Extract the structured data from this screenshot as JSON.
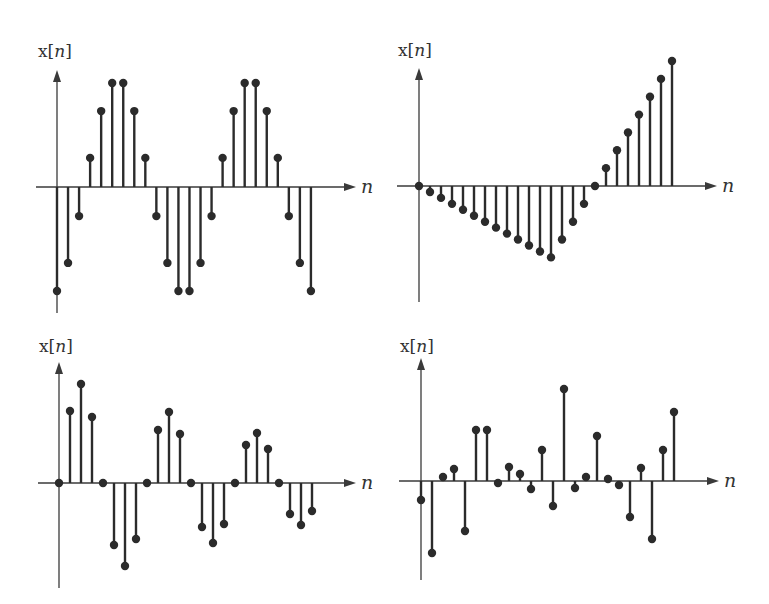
{
  "figure": {
    "panel_count": 4,
    "ink_color": "#2b2b2b",
    "axis_color": "#3a3a3a",
    "background": "#ffffff"
  },
  "chart_data": [
    {
      "type": "stem",
      "panel": "top-left",
      "title": "",
      "ylabel": "x[n]",
      "xlabel": "n",
      "description": "sampled sinusoid (periodic, period 12)",
      "x": [
        0,
        1,
        2,
        3,
        4,
        5,
        6,
        7,
        8,
        9,
        10,
        11,
        12,
        13,
        14,
        15,
        16,
        17,
        18,
        19,
        20,
        21,
        22,
        23
      ],
      "values": [
        -1.0,
        -0.73,
        -0.28,
        0.28,
        0.73,
        1.0,
        1.0,
        0.73,
        0.28,
        -0.28,
        -0.73,
        -1.0,
        -1.0,
        -0.73,
        -0.28,
        0.28,
        0.73,
        1.0,
        1.0,
        0.73,
        0.28,
        -0.28,
        -0.73,
        -1.0
      ],
      "ylim": [
        -1.15,
        1.15
      ],
      "grid": false
    },
    {
      "type": "stem",
      "panel": "top-right",
      "title": "",
      "ylabel": "x[n]",
      "xlabel": "n",
      "description": "piecewise-linear ramp: decreasing, then rising back to zero, then increasing",
      "x": [
        0,
        1,
        2,
        3,
        4,
        5,
        6,
        7,
        8,
        9,
        10,
        11,
        12,
        13,
        14,
        15,
        16,
        17,
        18,
        19,
        20,
        21,
        22,
        23
      ],
      "values": [
        0,
        -1,
        -2,
        -3,
        -4,
        -5,
        -6,
        -7,
        -8,
        -9,
        -10,
        -11,
        -12,
        -9,
        -6,
        -3,
        0,
        3,
        6,
        9,
        12,
        15,
        18,
        21
      ],
      "ylim": [
        -20,
        23
      ],
      "grid": false
    },
    {
      "type": "stem",
      "panel": "bottom-left",
      "title": "",
      "ylabel": "x[n]",
      "xlabel": "n",
      "description": "exponentially decaying sinusoid",
      "x": [
        0,
        1,
        2,
        3,
        4,
        5,
        6,
        7,
        8,
        9,
        10,
        11,
        12,
        13,
        14,
        15,
        16,
        17,
        18,
        19,
        20,
        21,
        22,
        23
      ],
      "values": [
        0,
        0.72,
        0.99,
        0.66,
        0,
        -0.62,
        -0.83,
        -0.56,
        0,
        0.53,
        0.71,
        0.49,
        0,
        -0.44,
        -0.6,
        -0.41,
        0,
        0.38,
        0.5,
        0.34,
        0,
        -0.31,
        -0.42,
        -0.28
      ],
      "ylim": [
        -1.05,
        1.2
      ],
      "grid": false
    },
    {
      "type": "stem",
      "panel": "bottom-right",
      "title": "",
      "ylabel": "x[n]",
      "xlabel": "n",
      "description": "random (noise-like) sequence",
      "x": [
        0,
        1,
        2,
        3,
        4,
        5,
        6,
        7,
        8,
        9,
        10,
        11,
        12,
        13,
        14,
        15,
        16,
        17,
        18,
        19,
        20,
        21,
        22,
        23
      ],
      "values": [
        -0.19,
        -0.72,
        0.04,
        0.12,
        -0.5,
        0.51,
        0.51,
        -0.02,
        0.14,
        0.07,
        -0.08,
        0.31,
        -0.25,
        0.92,
        -0.07,
        0.04,
        0.45,
        0.02,
        -0.04,
        -0.36,
        0.13,
        -0.58,
        0.31,
        0.69
      ],
      "ylim": [
        -1.0,
        1.2
      ],
      "grid": false
    }
  ],
  "panels": [
    {
      "ylabel_pre": "x[",
      "ylabel_var": "n",
      "ylabel_post": "]",
      "xlabel": "n",
      "origin": [
        57,
        187
      ],
      "dx": 11.04,
      "scale": 104,
      "xaxis": [
        36,
        356
      ],
      "yaxis": [
        70,
        313
      ],
      "label_pos": [
        38,
        57
      ]
    },
    {
      "ylabel_pre": "x[",
      "ylabel_var": "n",
      "ylabel_post": "]",
      "xlabel": "n",
      "origin": [
        419,
        186
      ],
      "dx": 11.0,
      "scale": 5.95,
      "xaxis": [
        397,
        717
      ],
      "yaxis": [
        68,
        302
      ],
      "label_pos": [
        398,
        56
      ]
    },
    {
      "ylabel_pre": "x[",
      "ylabel_var": "n",
      "ylabel_post": "]",
      "xlabel": "n",
      "origin": [
        59,
        483
      ],
      "dx": 11.0,
      "scale": 100,
      "xaxis": [
        38,
        356
      ],
      "yaxis": [
        362,
        588
      ],
      "label_pos": [
        39,
        352
      ]
    },
    {
      "ylabel_pre": "x[",
      "ylabel_var": "n",
      "ylabel_post": "]",
      "xlabel": "n",
      "origin": [
        421,
        481
      ],
      "dx": 11.0,
      "scale": 100,
      "xaxis": [
        399,
        719
      ],
      "yaxis": [
        358,
        580
      ],
      "label_pos": [
        400,
        352
      ]
    }
  ]
}
